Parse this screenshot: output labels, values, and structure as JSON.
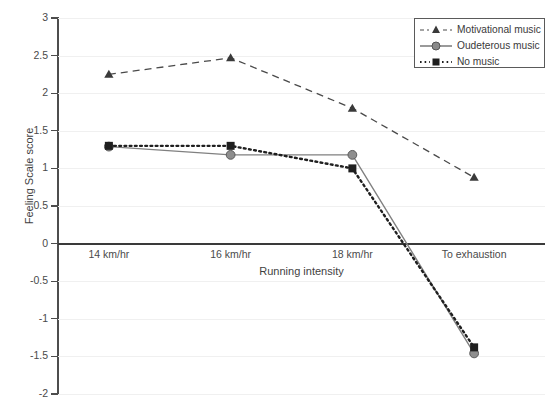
{
  "chart_data": {
    "type": "line",
    "title": "",
    "xlabel": "Running intensity",
    "ylabel": "Feeling Scale score",
    "categories": [
      "14 km/hr",
      "16 km/hr",
      "18 km/hr",
      "To exhaustion"
    ],
    "ylim": [
      -2,
      3
    ],
    "ytick_step": 0.5,
    "yticks": [
      "3",
      "2.5",
      "2",
      "1.5",
      "1",
      "0.5",
      "0",
      "-0.5",
      "-1",
      "-1.5",
      "-2"
    ],
    "ytick_values": [
      3,
      2.5,
      2,
      1.5,
      1,
      0.5,
      0,
      -0.5,
      -1,
      -1.5,
      -2
    ],
    "grid": true,
    "legend_position": "top-right",
    "series": [
      {
        "name": "Motivational music",
        "values": [
          2.25,
          2.47,
          1.8,
          0.88
        ],
        "color": "#4a4a4a",
        "line_style": "dashed",
        "marker": "triangle"
      },
      {
        "name": "Oudeterous music",
        "values": [
          1.29,
          1.18,
          1.18,
          -1.46
        ],
        "color": "#808080",
        "line_style": "solid",
        "marker": "circle"
      },
      {
        "name": "No music",
        "values": [
          1.3,
          1.3,
          1.0,
          -1.38
        ],
        "color": "#1f1f1f",
        "line_style": "dotted",
        "marker": "square"
      }
    ]
  },
  "legend": {
    "entries": [
      {
        "label": "Motivational music"
      },
      {
        "label": "Oudeterous music"
      },
      {
        "label": "No music"
      }
    ]
  }
}
